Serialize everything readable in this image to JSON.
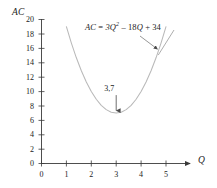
{
  "chart_data": {
    "type": "line",
    "title": "",
    "subtitle": "",
    "xlabel": "Q",
    "ylabel": "AC",
    "equation_label": "AC = 3Q² – 18Q + 34",
    "equation_parts": {
      "lhs": "AC",
      "equals": "=",
      "term1_coeff": "3",
      "term1_var": "Q",
      "term1_exp": "2",
      "term2": "– 18",
      "term2_var": "Q",
      "term3": "+ 34"
    },
    "xlim": [
      0,
      5
    ],
    "ylim": [
      0,
      20
    ],
    "xticks": [
      0,
      1,
      2,
      3,
      4,
      5
    ],
    "yticks": [
      0,
      2,
      4,
      6,
      8,
      10,
      12,
      14,
      16,
      18,
      20
    ],
    "xtick_labels": [
      "0",
      "1",
      "2",
      "3",
      "4",
      "5"
    ],
    "ytick_labels": [
      "0",
      "2",
      "4",
      "6",
      "8",
      "10",
      "12",
      "14",
      "16",
      "18",
      "20"
    ],
    "grid": false,
    "legend": null,
    "curve_domain": [
      1.0,
      5.0
    ],
    "series": [
      {
        "name": "AC = 3Q² – 18Q + 34",
        "color": "#b9b9b9",
        "x": [
          1.0,
          1.2,
          1.4,
          1.6,
          1.8,
          2.0,
          2.2,
          2.4,
          2.6,
          2.8,
          3.0,
          3.2,
          3.4,
          3.6,
          3.8,
          4.0,
          4.2,
          4.4,
          4.6,
          4.8,
          5.0
        ],
        "values": [
          19.0,
          16.72,
          14.68,
          12.88,
          11.32,
          10.0,
          8.92,
          8.08,
          7.48,
          7.12,
          7.0,
          7.12,
          7.48,
          8.08,
          8.92,
          10.0,
          11.32,
          12.88,
          14.68,
          16.72,
          19.0
        ]
      }
    ],
    "annotations": [
      {
        "name": "vertex",
        "text": "3,7",
        "x": 3,
        "y": 7,
        "arrow": "down"
      },
      {
        "name": "equation-pointer",
        "text": "",
        "x": 4.65,
        "y": 15.9,
        "arrow": "leader-line"
      }
    ],
    "colors": {
      "curve": "#b9b9b9",
      "axis": "#3a3a3a",
      "text": "#222222",
      "background": "#ffffff",
      "annotation_line": "#555555"
    }
  }
}
